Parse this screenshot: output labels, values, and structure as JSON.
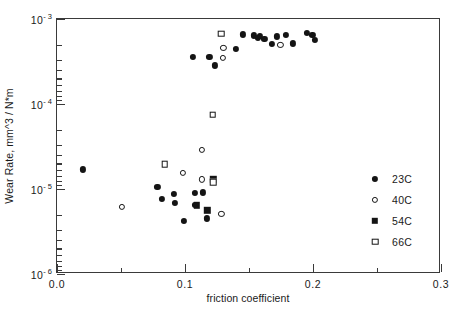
{
  "chart_data": {
    "type": "scatter",
    "title": "",
    "xlabel": "friction coefficient",
    "ylabel": "Wear Rate,  mm^3 / N*m",
    "xlim": [
      0.0,
      0.3
    ],
    "ylim": [
      1e-06,
      0.001
    ],
    "yscale": "log",
    "xscale": "linear",
    "grid": false,
    "legend_position": "lower-right-inside",
    "x_ticks": [
      "0.0",
      "0.1",
      "0.2",
      "0.3"
    ],
    "x_tick_values": [
      0.0,
      0.1,
      0.2,
      0.3
    ],
    "x_minor_tick_values": [
      0.05,
      0.15,
      0.25
    ],
    "y_ticks": [
      "10-3",
      "10-4",
      "10-5",
      "10-6"
    ],
    "y_tick_mantissa": [
      "10",
      "10",
      "10",
      "10"
    ],
    "y_tick_exponent": [
      "- 3",
      "- 4",
      "- 5",
      "- 6"
    ],
    "y_tick_values": [
      0.001,
      0.0001,
      1e-05,
      1e-06
    ],
    "series": [
      {
        "name": "23C",
        "marker": "filled-circle",
        "color": "#141414",
        "points": [
          [
            0.0205,
            1.7e-05
          ],
          [
            0.0785,
            1.05e-05
          ],
          [
            0.082,
            7.6e-06
          ],
          [
            0.0915,
            8.7e-06
          ],
          [
            0.092,
            6.9e-06
          ],
          [
            0.099,
            4.2e-06
          ],
          [
            0.1075,
            9e-06
          ],
          [
            0.108,
            6.5e-06
          ],
          [
            0.114,
            9.1e-06
          ],
          [
            0.117,
            4.5e-06
          ],
          [
            0.1215,
            1.3e-05
          ],
          [
            0.106,
            0.000355
          ],
          [
            0.119,
            0.00036
          ],
          [
            0.1235,
            0.000285
          ],
          [
            0.1395,
            0.00044
          ],
          [
            0.1455,
            0.00066
          ],
          [
            0.154,
            0.00064
          ],
          [
            0.157,
            0.000605
          ],
          [
            0.1585,
            0.00063
          ],
          [
            0.162,
            0.000585
          ],
          [
            0.168,
            0.00051
          ],
          [
            0.1715,
            0.000625
          ],
          [
            0.179,
            0.000655
          ],
          [
            0.1845,
            0.000515
          ],
          [
            0.195,
            0.00068
          ],
          [
            0.1995,
            0.00065
          ],
          [
            0.2015,
            0.00057
          ]
        ]
      },
      {
        "name": "40C",
        "marker": "open-circle",
        "color": "#141414",
        "points": [
          [
            0.0505,
            6.2e-06
          ],
          [
            0.0985,
            1.55e-05
          ],
          [
            0.1135,
            1.3e-05
          ],
          [
            0.113,
            2.9e-05
          ],
          [
            0.1285,
            5.1e-06
          ],
          [
            0.1295,
            0.000345
          ],
          [
            0.13,
            0.00046
          ],
          [
            0.1745,
            0.0005
          ]
        ]
      },
      {
        "name": "54C",
        "marker": "filled-square",
        "color": "#141414",
        "points": [
          [
            0.109,
            6.4e-06
          ],
          [
            0.1175,
            5.6e-06
          ],
          [
            0.122,
            1.3e-05
          ]
        ]
      },
      {
        "name": "66C",
        "marker": "open-square",
        "color": "#141414",
        "points": [
          [
            0.084,
            1.95e-05
          ],
          [
            0.122,
            1.2e-05
          ],
          [
            0.1215,
            7.5e-05
          ],
          [
            0.1285,
            0.00067
          ]
        ]
      }
    ]
  },
  "legend": {
    "items": [
      {
        "label": "23C",
        "marker": "filled-circle"
      },
      {
        "label": "40C",
        "marker": "open-circle"
      },
      {
        "label": "54C",
        "marker": "filled-square"
      },
      {
        "label": "66C",
        "marker": "open-square"
      }
    ]
  }
}
